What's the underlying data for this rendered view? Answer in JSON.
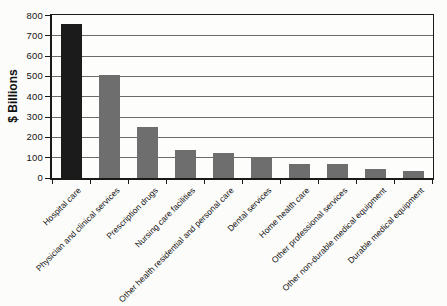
{
  "chart_data": {
    "type": "bar",
    "title": "",
    "ylabel": "$ Billions",
    "xlabel": "",
    "ylim": [
      0,
      800
    ],
    "yticks": [
      0,
      100,
      200,
      300,
      400,
      500,
      600,
      700,
      800
    ],
    "grid": "horizontal",
    "legend": "none",
    "x_tick_label_rotation_deg": 45,
    "categories": [
      "Hospital care",
      "Physician and clinical services",
      "Prescription drugs",
      "Nursing care facilities",
      "Other health residential and personal care",
      "Dental services",
      "Home health care",
      "Other professional services",
      "Other non-durable medical equipment",
      "Durable medical equipment"
    ],
    "values": [
      760,
      505,
      250,
      137,
      122,
      102,
      68,
      67,
      44,
      35
    ]
  },
  "style": {
    "highlight_bar_color": "#1b1b1b",
    "bar_color": "#6e6e6e",
    "gridline_color": "#6a6a6a",
    "frame_color": "#1a1a1a",
    "text_color": "#141414",
    "background_color": "#fcfcfa"
  }
}
